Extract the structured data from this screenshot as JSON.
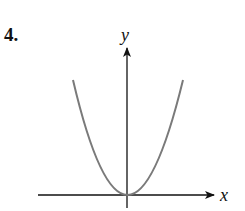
{
  "problem": {
    "number": "4."
  },
  "axes": {
    "x_label": "x",
    "y_label": "y"
  },
  "curve": {
    "type": "parabola",
    "description": "upward-opening parabola with vertex at origin",
    "color": "#7a7a7a"
  },
  "colors": {
    "axis": "#111111",
    "curve": "#7a7a7a"
  }
}
